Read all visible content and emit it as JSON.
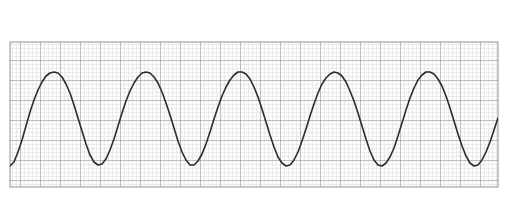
{
  "strip": {
    "lead_label": "II",
    "width": 508,
    "height": 204,
    "background_color": "#ffffff",
    "grid": {
      "x": 10,
      "y": 42,
      "width": 488,
      "height": 145,
      "small_box_px": 4,
      "large_box_px": 20,
      "minor_color": "#c9c4c6",
      "major_color": "#8d8689",
      "paper_color": "#fdfcfc"
    },
    "trace": {
      "color": "#2b2b2b",
      "width_px": 1.6
    },
    "ticks": [
      {
        "name": "tick-1",
        "x": 148,
        "y": 4,
        "height": 22,
        "color": "#6e6e6e"
      },
      {
        "name": "tick-2",
        "x": 427,
        "y": 4,
        "height": 22,
        "color": "#6e6e6e"
      }
    ]
  },
  "chart_data": {
    "type": "line",
    "title": "",
    "subtitle": "",
    "xlabel": "",
    "ylabel": "",
    "legend": [
      "II"
    ],
    "legend_position": "top-left",
    "grid": true,
    "waveform_description": "sinusoidal rhythm",
    "xlim": [
      10,
      498
    ],
    "ylim": [
      187,
      42
    ],
    "baseline_y": 118,
    "amplitude_px": 46,
    "period_px": 74,
    "peak_y": 72,
    "trough_y": 165,
    "cycles": 6,
    "peaks_x": [
      52,
      126,
      200,
      290,
      360,
      432
    ],
    "troughs_x": [
      90,
      163,
      237,
      325,
      396,
      470
    ],
    "series": [
      {
        "name": "II",
        "x": [
          10,
          14,
          18,
          22,
          26,
          30,
          34,
          38,
          42,
          46,
          50,
          54,
          58,
          62,
          66,
          70,
          74,
          78,
          82,
          86,
          90,
          94,
          98,
          102,
          106,
          110,
          114,
          118,
          122,
          126,
          130,
          134,
          138,
          142,
          146,
          150,
          154,
          158,
          162,
          166,
          170,
          174,
          178,
          182,
          186,
          190,
          194,
          198,
          202,
          206,
          210,
          214,
          218,
          222,
          226,
          230,
          234,
          238,
          242,
          246,
          250,
          254,
          258,
          262,
          266,
          270,
          274,
          278,
          282,
          286,
          290,
          294,
          298,
          302,
          306,
          310,
          314,
          318,
          322,
          326,
          330,
          334,
          338,
          342,
          346,
          350,
          354,
          358,
          362,
          366,
          370,
          374,
          378,
          382,
          386,
          390,
          394,
          398,
          402,
          406,
          410,
          414,
          418,
          422,
          426,
          430,
          434,
          438,
          442,
          446,
          450,
          454,
          458,
          462,
          466,
          470,
          474,
          478,
          482,
          486,
          490,
          494,
          498
        ],
        "y": [
          166,
          162,
          152,
          140,
          126,
          112,
          100,
          90,
          82,
          76,
          73,
          72,
          73,
          77,
          84,
          93,
          105,
          118,
          131,
          144,
          155,
          162,
          165,
          164,
          159,
          150,
          139,
          126,
          113,
          101,
          91,
          83,
          77,
          73,
          72,
          73,
          77,
          83,
          92,
          103,
          115,
          128,
          141,
          152,
          160,
          165,
          165,
          161,
          154,
          144,
          132,
          119,
          107,
          96,
          87,
          80,
          75,
          72,
          72,
          74,
          79,
          87,
          97,
          109,
          122,
          135,
          147,
          157,
          163,
          166,
          165,
          160,
          152,
          141,
          129,
          116,
          104,
          93,
          84,
          78,
          74,
          72,
          73,
          76,
          82,
          91,
          101,
          113,
          126,
          139,
          151,
          160,
          165,
          166,
          163,
          157,
          148,
          136,
          123,
          110,
          98,
          88,
          80,
          75,
          72,
          72,
          74,
          79,
          86,
          96,
          108,
          121,
          134,
          146,
          156,
          163,
          166,
          165,
          160,
          152,
          142,
          130,
          118
        ]
      }
    ]
  }
}
